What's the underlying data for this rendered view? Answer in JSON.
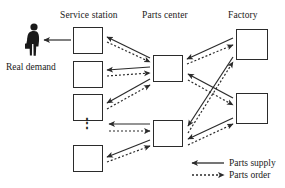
{
  "diagram": {
    "columns": [
      {
        "id": "service-station",
        "label": "Service station"
      },
      {
        "id": "parts-center",
        "label": "Parts center"
      },
      {
        "id": "factory",
        "label": "Factory"
      }
    ],
    "actor": {
      "icon": "businessperson-with-briefcase-icon",
      "label": "Real demand"
    },
    "ellipsis": "⋮",
    "nodes": {
      "service_stations": [
        {
          "id": "ss1",
          "label": ""
        },
        {
          "id": "ss2",
          "label": ""
        },
        {
          "id": "ss3",
          "label": ""
        },
        {
          "id": "ss4",
          "label": ""
        }
      ],
      "parts_centers": [
        {
          "id": "pc1",
          "label": ""
        },
        {
          "id": "pc2",
          "label": ""
        }
      ],
      "factories": [
        {
          "id": "f1",
          "label": ""
        },
        {
          "id": "f2",
          "label": ""
        }
      ]
    },
    "legend": {
      "items": [
        {
          "id": "parts-supply",
          "label": "Parts supply",
          "style": "solid",
          "arrow": "left"
        },
        {
          "id": "parts-order",
          "label": "Parts order",
          "style": "dotted",
          "arrow": "right"
        }
      ]
    },
    "colors": {
      "stroke": "#2b2b2b",
      "text": "#1a1a1a",
      "background": "#ffffff"
    }
  }
}
